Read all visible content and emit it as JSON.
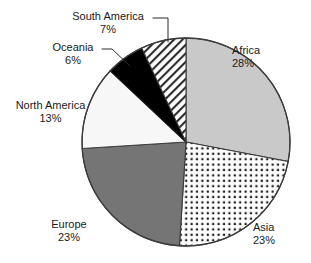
{
  "chart_data": {
    "type": "pie",
    "title": "",
    "subtitle": "",
    "xlabel": "",
    "ylabel": "",
    "legend_position": "none",
    "grid": false,
    "labels_show_percent": true,
    "start_angle_deg": 0,
    "direction": "clockwise",
    "categories": [
      "Africa",
      "Asia",
      "Europe",
      "North America",
      "Oceania",
      "South America"
    ],
    "values": [
      28,
      23,
      23,
      13,
      6,
      7
    ],
    "units": "%",
    "slices": [
      {
        "name": "Africa",
        "percent": 28,
        "label": "Africa",
        "value_label": "28%",
        "fill": "#c9c9c9",
        "pattern": "solid-light-gray"
      },
      {
        "name": "Asia",
        "percent": 23,
        "label": "Asia",
        "value_label": "23%",
        "fill": "#ffffff",
        "pattern": "dots"
      },
      {
        "name": "Europe",
        "percent": 23,
        "label": "Europe",
        "value_label": "23%",
        "fill": "#757575",
        "pattern": "solid-dark-gray"
      },
      {
        "name": "North America",
        "percent": 13,
        "label": "North America",
        "value_label": "13%",
        "fill": "#f7f7f7",
        "pattern": "solid-white"
      },
      {
        "name": "Oceania",
        "percent": 6,
        "label": "Oceania",
        "value_label": "6%",
        "fill": "#000000",
        "pattern": "solid-black"
      },
      {
        "name": "South America",
        "percent": 7,
        "label": "South America",
        "value_label": "7%",
        "fill": "#ffffff",
        "pattern": "diagonal-hatch"
      }
    ],
    "colors": {
      "africa": "#c9c9c9",
      "asia": "#ffffff",
      "europe": "#757575",
      "north_america": "#f7f7f7",
      "oceania": "#000000",
      "south_america": "#ffffff",
      "outline": "#3c3c3c",
      "text": "#1a1a1a",
      "background": "#ffffff"
    }
  }
}
